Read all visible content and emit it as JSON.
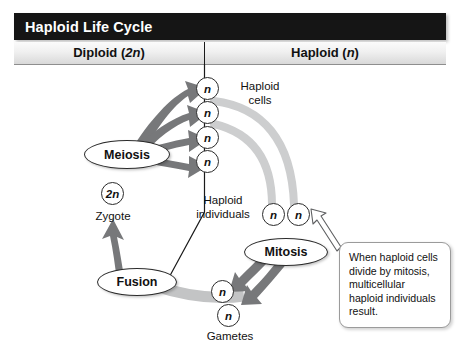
{
  "figure": {
    "title": "Haploid Life Cycle",
    "columns": {
      "left": "Diploid (2n)",
      "right": "Haploid (n)",
      "left_plain": "Diploid",
      "left_ploidy": "2n",
      "right_plain": "Haploid",
      "right_ploidy": "n"
    }
  },
  "stages": {
    "meiosis": "Meiosis",
    "mitosis": "Mitosis",
    "fusion": "Fusion"
  },
  "cells": {
    "zygote_symbol": "2n",
    "zygote_label": "Zygote",
    "haploid_symbol": "n",
    "haploid_cells_label": "Haploid\ncells",
    "haploid_individuals_label": "Haploid\nindividuals",
    "gametes_label": "Gametes",
    "haploid_cells_count": 4,
    "haploid_individuals_count": 2,
    "gametes_count": 2
  },
  "callout": {
    "text": "When haploid cells divide by mitosis, multicellular haploid individuals result."
  },
  "colors": {
    "title_bar": "#151515",
    "title_text": "#ffffff",
    "subhead_top": "#fbfbfb",
    "subhead_bottom": "#d9d9d9",
    "arrow_dark": "#77787a",
    "arrow_light": "#c9cacb",
    "outline": "#2b2b2b",
    "text": "#111111"
  }
}
